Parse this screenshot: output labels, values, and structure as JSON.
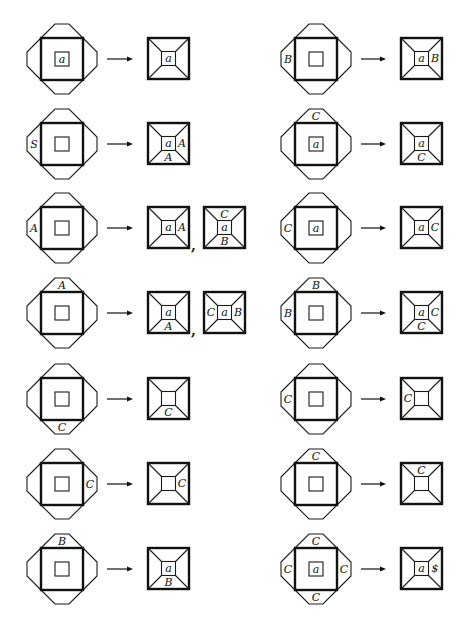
{
  "figure": {
    "rows": [
      {
        "left": {
          "input": {
            "inner": "a",
            "top": "",
            "bottom": "",
            "left": "",
            "right": ""
          },
          "outputs": [
            {
              "inner": "a",
              "top": "",
              "bottom": "",
              "left": "",
              "right": ""
            }
          ]
        },
        "right": {
          "input": {
            "inner": "",
            "top": "",
            "bottom": "",
            "left": "B",
            "right": ""
          },
          "outputs": [
            {
              "inner": "a",
              "top": "",
              "bottom": "",
              "left": "",
              "right": "B"
            }
          ]
        }
      },
      {
        "left": {
          "input": {
            "inner": "",
            "top": "",
            "bottom": "",
            "left": "S",
            "right": ""
          },
          "outputs": [
            {
              "inner": "a",
              "top": "",
              "bottom": "A",
              "left": "",
              "right": "A"
            }
          ]
        },
        "right": {
          "input": {
            "inner": "a",
            "top": "C",
            "bottom": "",
            "left": "",
            "right": ""
          },
          "outputs": [
            {
              "inner": "a",
              "top": "",
              "bottom": "C",
              "left": "",
              "right": ""
            }
          ]
        }
      },
      {
        "left": {
          "input": {
            "inner": "",
            "top": "",
            "bottom": "",
            "left": "A",
            "right": ""
          },
          "outputs": [
            {
              "inner": "a",
              "top": "",
              "bottom": "",
              "left": "",
              "right": "A"
            },
            {
              "inner": "a",
              "top": "C",
              "bottom": "B",
              "left": "",
              "right": ""
            }
          ]
        },
        "right": {
          "input": {
            "inner": "a",
            "top": "",
            "bottom": "",
            "left": "C",
            "right": ""
          },
          "outputs": [
            {
              "inner": "a",
              "top": "",
              "bottom": "",
              "left": "",
              "right": "C"
            }
          ]
        }
      },
      {
        "left": {
          "input": {
            "inner": "",
            "top": "A",
            "bottom": "",
            "left": "",
            "right": ""
          },
          "outputs": [
            {
              "inner": "a",
              "top": "",
              "bottom": "A",
              "left": "",
              "right": ""
            },
            {
              "inner": "a",
              "top": "",
              "bottom": "",
              "left": "C",
              "right": "B"
            }
          ]
        },
        "right": {
          "input": {
            "inner": "",
            "top": "B",
            "bottom": "",
            "left": "B",
            "right": ""
          },
          "outputs": [
            {
              "inner": "a",
              "top": "",
              "bottom": "C",
              "left": "",
              "right": "C"
            }
          ]
        }
      },
      {
        "left": {
          "input": {
            "inner": "",
            "top": "",
            "bottom": "C",
            "left": "",
            "right": ""
          },
          "outputs": [
            {
              "inner": "",
              "top": "",
              "bottom": "C",
              "left": "",
              "right": ""
            }
          ]
        },
        "right": {
          "input": {
            "inner": "",
            "top": "",
            "bottom": "",
            "left": "C",
            "right": ""
          },
          "outputs": [
            {
              "inner": "",
              "top": "",
              "bottom": "",
              "left": "C",
              "right": ""
            }
          ]
        }
      },
      {
        "left": {
          "input": {
            "inner": "",
            "top": "",
            "bottom": "",
            "left": "",
            "right": "C"
          },
          "outputs": [
            {
              "inner": "",
              "top": "",
              "bottom": "",
              "left": "",
              "right": "C"
            }
          ]
        },
        "right": {
          "input": {
            "inner": "",
            "top": "C",
            "bottom": "",
            "left": "",
            "right": ""
          },
          "outputs": [
            {
              "inner": "",
              "top": "C",
              "bottom": "",
              "left": "",
              "right": ""
            }
          ]
        }
      },
      {
        "left": {
          "input": {
            "inner": "",
            "top": "B",
            "bottom": "",
            "left": "",
            "right": ""
          },
          "outputs": [
            {
              "inner": "a",
              "top": "",
              "bottom": "B",
              "left": "",
              "right": ""
            }
          ]
        },
        "right": {
          "input": {
            "inner": "a",
            "top": "C",
            "bottom": "C",
            "left": "C",
            "right": "C"
          },
          "outputs": [
            {
              "inner": "a",
              "top": "",
              "bottom": "",
              "left": "",
              "right": "$"
            }
          ]
        }
      }
    ],
    "separator": ",",
    "arrow": "→"
  }
}
